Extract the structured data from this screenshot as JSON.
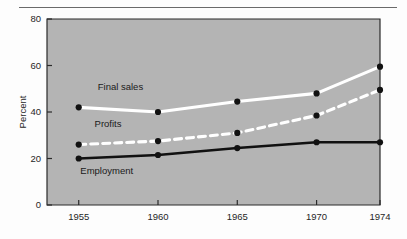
{
  "figure": {
    "background_color": "#fdfdfd",
    "plot_background_color": "#b4b4b4",
    "axis_color": "#2b2b2b",
    "rule_color": "#6a6a6a"
  },
  "chart_data": {
    "type": "line",
    "title": "",
    "subtitle": "",
    "xlabel": "",
    "ylabel": "Percent",
    "categories": [
      "1955",
      "1960",
      "1965",
      "1970",
      "1974"
    ],
    "x": [
      1955,
      1960,
      1965,
      1970,
      1974
    ],
    "xlim": [
      1953,
      1974
    ],
    "ylim": [
      0,
      80
    ],
    "ytick_labels": [
      "0",
      "20",
      "40",
      "60",
      "80"
    ],
    "yticks": [
      0,
      20,
      40,
      60,
      80
    ],
    "xtick_labels": [
      "1955",
      "1960",
      "1965",
      "1970",
      "1974"
    ],
    "grid": false,
    "legend": "inline-annotations",
    "marker": "filled-circle",
    "marker_color": "#111111",
    "series": [
      {
        "name": "Final sales",
        "values": [
          42,
          40,
          44.5,
          48,
          59.5
        ],
        "color": "#ffffff",
        "style": "solid",
        "width": 3.1,
        "label_x": 1956.2,
        "label_y": 49.5
      },
      {
        "name": "Profits",
        "values": [
          26,
          27.5,
          31,
          38.5,
          49.5
        ],
        "color": "#ffffff",
        "style": "dashed",
        "width": 3.1,
        "label_x": 1956.0,
        "label_y": 33.5
      },
      {
        "name": "Employment",
        "values": [
          20,
          21.5,
          24.5,
          27,
          27
        ],
        "color": "#111111",
        "style": "solid",
        "width": 2.6,
        "label_x": 1955.1,
        "label_y": 13.3
      }
    ]
  }
}
